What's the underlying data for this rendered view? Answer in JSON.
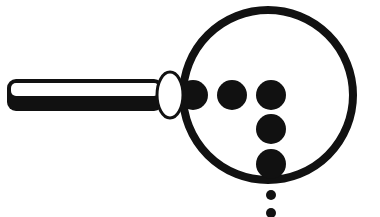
{
  "illustration": {
    "subject": "magnifying-glass-with-dots",
    "colors": {
      "ink": "#111111",
      "paper": "#ffffff"
    },
    "handle": {
      "x": 7,
      "y": 79,
      "width": 156,
      "height": 32,
      "radius": 9
    },
    "collar": {
      "cx": 170,
      "cy": 95,
      "rx": 13,
      "ry": 23
    },
    "lens": {
      "cx": 268,
      "cy": 95,
      "r": 85,
      "stroke": 8
    },
    "dots": [
      {
        "cx": 193,
        "cy": 95,
        "r": 15
      },
      {
        "cx": 232,
        "cy": 95,
        "r": 15
      },
      {
        "cx": 271,
        "cy": 95,
        "r": 15
      },
      {
        "cx": 271,
        "cy": 129,
        "r": 15
      },
      {
        "cx": 271,
        "cy": 164,
        "r": 15
      },
      {
        "cx": 271,
        "cy": 195,
        "r": 5
      },
      {
        "cx": 271,
        "cy": 213,
        "r": 5
      }
    ]
  }
}
